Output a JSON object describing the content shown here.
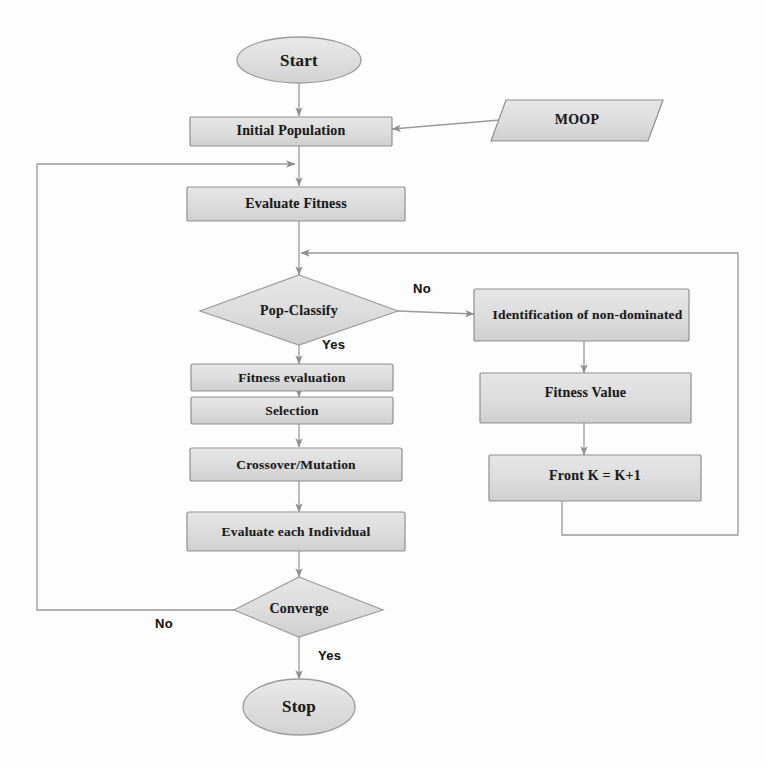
{
  "diagram": {
    "colors": {
      "node_fill": "#d9d9d9",
      "node_fill_light": "#e2e2e2",
      "node_stroke": "#8c8c8c",
      "edge_stroke": "#9a9a9a",
      "text": "#1b1b1b",
      "background": "#fdfdfd"
    },
    "nodes": [
      {
        "id": "start",
        "shape": "ellipse",
        "label": "Start"
      },
      {
        "id": "initial_pop",
        "shape": "rectangle",
        "label": "Initial Population"
      },
      {
        "id": "moop",
        "shape": "parallelogram",
        "label": "MOOP"
      },
      {
        "id": "eval_fitness",
        "shape": "rectangle",
        "label": "Evaluate Fitness"
      },
      {
        "id": "pop_classify",
        "shape": "diamond",
        "label": "Pop-Classify"
      },
      {
        "id": "fitness_eval",
        "shape": "rectangle",
        "label": "Fitness evaluation"
      },
      {
        "id": "selection",
        "shape": "rectangle",
        "label": "Selection"
      },
      {
        "id": "crossover",
        "shape": "rectangle",
        "label": "Crossover/Mutation"
      },
      {
        "id": "eval_each",
        "shape": "rectangle",
        "label": "Evaluate each Individual"
      },
      {
        "id": "converge",
        "shape": "diamond",
        "label": "Converge"
      },
      {
        "id": "stop",
        "shape": "ellipse",
        "label": "Stop"
      },
      {
        "id": "identify",
        "shape": "rectangle",
        "label": "Identification of non-dominated"
      },
      {
        "id": "fitness_val",
        "shape": "rectangle",
        "label": "Fitness Value"
      },
      {
        "id": "front_k",
        "shape": "rectangle",
        "label": "Front K = K+1"
      }
    ],
    "edge_labels": [
      {
        "id": "classify_no",
        "label": "No",
        "from": "pop_classify",
        "to": "identify"
      },
      {
        "id": "classify_yes",
        "label": "Yes",
        "from": "pop_classify",
        "to": "fitness_eval"
      },
      {
        "id": "converge_no",
        "label": "No",
        "from": "converge",
        "to": "eval_fitness"
      },
      {
        "id": "converge_yes",
        "label": "Yes",
        "from": "converge",
        "to": "stop"
      }
    ]
  }
}
